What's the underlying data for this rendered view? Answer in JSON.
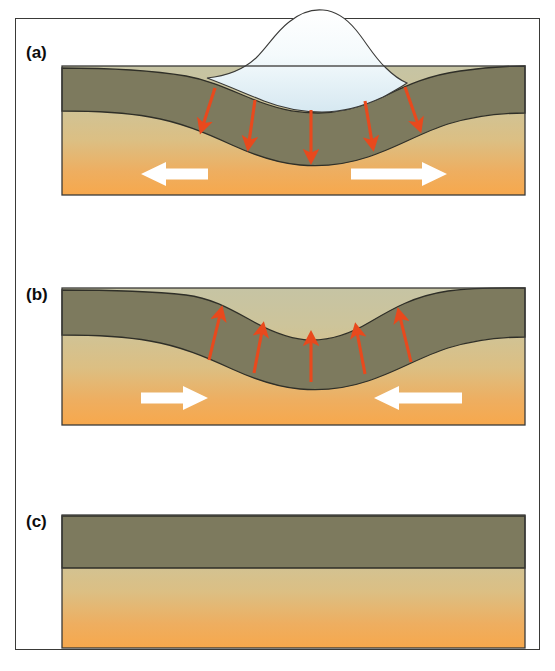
{
  "figure": {
    "type": "three-panel cross-section diagram",
    "background_color": "#ffffff",
    "frame_color": "#3a3a38"
  },
  "colors": {
    "crust": "#7d7a5e",
    "crust_outline": "#2f2f28",
    "mantle_top": "#c6c4a4",
    "mantle_mid": "#d9c189",
    "mantle_bottom": "#f7a84c",
    "ice_fill_top": "#ffffff",
    "ice_fill_bottom": "#dbeaf2",
    "ice_outline": "#3a3a38",
    "red_arrow": "#e8491d",
    "white_arrow": "#ffffff",
    "text": "#0d0d0d"
  },
  "panels": [
    {
      "letter": "(a)",
      "caption_state": "ice-loaded, crust depressed, mantle flowing outward",
      "labels": {
        "crust": "Crust",
        "ice": "Glacial ice",
        "mantle": "Mantle movement"
      },
      "has_ice": true,
      "red_arrows": {
        "count": 5,
        "direction": "downward-fanning-outward",
        "meaning": "load pressing crust down into mantle"
      },
      "white_arrows": {
        "count": 2,
        "direction": "outward",
        "left": "left-pointing",
        "right": "right-pointing"
      }
    },
    {
      "letter": "(b)",
      "caption_state": "ice removed, crust rebounding, mantle flowing inward",
      "labels": {
        "crust": "Crust",
        "mantle": "Mantle movement"
      },
      "has_ice": false,
      "red_arrows": {
        "count": 5,
        "direction": "upward-fanning-outward",
        "meaning": "crust rebounding upward"
      },
      "white_arrows": {
        "count": 2,
        "direction": "inward",
        "left": "right-pointing",
        "right": "left-pointing"
      }
    },
    {
      "letter": "(c)",
      "caption_state": "full isostatic rebound complete, crust flat",
      "labels": {
        "crust": "Crust"
      },
      "has_ice": false,
      "red_arrows": {
        "count": 0,
        "direction": "none",
        "meaning": "equilibrium reached"
      },
      "white_arrows": {
        "count": 0,
        "direction": "none",
        "left": "",
        "right": ""
      }
    }
  ]
}
